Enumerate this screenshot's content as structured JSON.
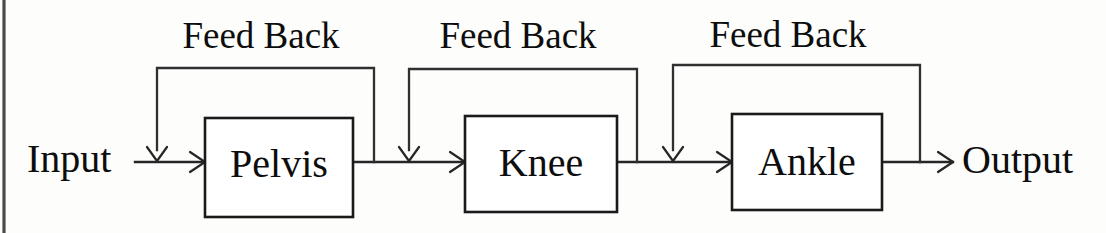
{
  "diagram": {
    "type": "block-diagram",
    "colors": {
      "background": "#fdfdfc",
      "stroke": "#1a1a1a",
      "text": "#0d0d0d",
      "page_edge": "#4a4a4a"
    },
    "input_label": "Input",
    "output_label": "Output",
    "blocks": [
      {
        "id": "pelvis",
        "label": "Pelvis",
        "x": 205,
        "y": 118,
        "w": 148,
        "h": 99
      },
      {
        "id": "knee",
        "label": "Knee",
        "x": 465,
        "y": 116,
        "w": 152,
        "h": 96
      },
      {
        "id": "ankle",
        "label": "Ankle",
        "x": 732,
        "y": 114,
        "w": 150,
        "h": 96
      }
    ],
    "feedback_loops": [
      {
        "id": "feedback-pelvis",
        "label": "Feed Back",
        "label_x": 261,
        "label_y": 48,
        "left_x": 157,
        "right_x": 374,
        "top_y": 68
      },
      {
        "id": "feedback-knee",
        "label": "Feed Back",
        "label_x": 518,
        "label_y": 48,
        "left_x": 409,
        "right_x": 637,
        "top_y": 69
      },
      {
        "id": "feedback-ankle",
        "label": "Feed Back",
        "label_x": 788,
        "label_y": 47,
        "left_x": 673,
        "right_x": 920,
        "top_y": 65
      }
    ],
    "main_line_y": 162,
    "input_text_x": 27,
    "output_text_x": 962,
    "io_text_y": 172
  }
}
